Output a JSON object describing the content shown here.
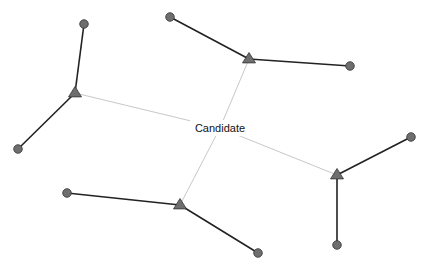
{
  "diagram": {
    "center_label": "Candidate",
    "center": {
      "x": 220,
      "y": 128
    },
    "colors": {
      "strong_edge": "#222222",
      "weak_edge": "#c8c8c8",
      "node_fill": "#6e6e6e",
      "node_stroke": "#333333"
    },
    "clusters": [
      {
        "id": "A",
        "hub": {
          "x": 75,
          "y": 93
        },
        "leaves": [
          {
            "x": 84,
            "y": 24
          },
          {
            "x": 18,
            "y": 149
          }
        ]
      },
      {
        "id": "B",
        "hub": {
          "x": 249,
          "y": 59
        },
        "leaves": [
          {
            "x": 170,
            "y": 17
          },
          {
            "x": 350,
            "y": 66
          }
        ]
      },
      {
        "id": "C",
        "hub": {
          "x": 337,
          "y": 175
        },
        "leaves": [
          {
            "x": 411,
            "y": 137
          },
          {
            "x": 337,
            "y": 245
          }
        ]
      },
      {
        "id": "D",
        "hub": {
          "x": 180,
          "y": 205
        },
        "leaves": [
          {
            "x": 67,
            "y": 193
          },
          {
            "x": 258,
            "y": 253
          }
        ]
      }
    ],
    "caption_partial": ""
  }
}
